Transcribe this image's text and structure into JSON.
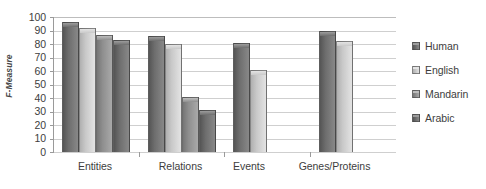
{
  "chart_data": {
    "type": "bar",
    "title": "",
    "subtitle": "",
    "xlabel": "",
    "ylabel": "F-Measure",
    "ylim": [
      0,
      100
    ],
    "ytick_step": 10,
    "yticks": [
      100,
      90,
      80,
      70,
      60,
      50,
      40,
      30,
      20,
      10,
      0
    ],
    "ytick_labels": [
      "100",
      "90",
      "80",
      "70",
      "60",
      "50",
      "40",
      "30",
      "20",
      "10",
      "0"
    ],
    "categories": [
      "Entities",
      "Relations",
      "Events",
      "Genes/Proteins"
    ],
    "grid": true,
    "grid_axis": "y",
    "legend_position": "right",
    "series": [
      {
        "name": "Human",
        "color": "#6e6e6e",
        "cap_color": "#9d9d9d",
        "values": [
          96,
          86,
          81,
          90
        ]
      },
      {
        "name": "English",
        "color": "#c9c9c9",
        "cap_color": "#e4e4e4",
        "values": [
          92,
          80,
          61,
          82
        ]
      },
      {
        "name": "Mandarin",
        "color": "#8f8f8f",
        "cap_color": "#bdbdbd",
        "values": [
          87,
          41,
          null,
          null
        ]
      },
      {
        "name": "Arabic",
        "color": "#6e6e6e",
        "cap_color": "#9d9d9d",
        "values": [
          83,
          31,
          null,
          null
        ]
      }
    ]
  },
  "legend": {
    "items": [
      {
        "label": "Human"
      },
      {
        "label": "English"
      },
      {
        "label": "Mandarin"
      },
      {
        "label": "Arabic"
      }
    ]
  },
  "axis": {
    "y_title": "F-Measure"
  },
  "colors": {
    "axis_line": "#9a9a9a",
    "gridline": "#cfcfcf",
    "text": "#3d3d3d",
    "background": "#ffffff"
  }
}
